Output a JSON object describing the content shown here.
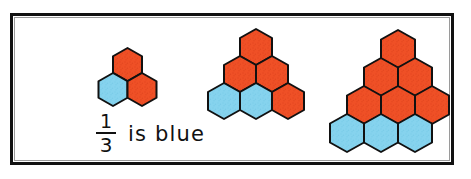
{
  "figure": {
    "kind": "hexagon-fraction-illustration",
    "background_color": "#ffffff",
    "frame_color": "#111111",
    "colors": {
      "orange": "#ef5026",
      "orange_shade": "#d8401a",
      "blue": "#86d3ee",
      "blue_shade": "#6ec4e4",
      "outline": "#111111",
      "text": "#111111"
    }
  },
  "caption": {
    "numerator": "1",
    "denominator": "3",
    "words": "is blue",
    "full_text": "1/3 is blue"
  },
  "groups": [
    {
      "name": "group-1",
      "total_hexagons": 3,
      "blue_hexagons": 1,
      "orange_hexagons": 2,
      "fraction_blue": "1/3",
      "rows": [
        {
          "count": 1,
          "colors": [
            "orange"
          ]
        },
        {
          "count": 2,
          "colors": [
            "blue",
            "orange"
          ]
        }
      ]
    },
    {
      "name": "group-2",
      "total_hexagons": 6,
      "blue_hexagons": 2,
      "orange_hexagons": 4,
      "fraction_blue": "2/6",
      "rows": [
        {
          "count": 1,
          "colors": [
            "orange"
          ]
        },
        {
          "count": 2,
          "colors": [
            "orange",
            "orange"
          ]
        },
        {
          "count": 3,
          "colors": [
            "blue",
            "blue",
            "orange"
          ]
        }
      ]
    },
    {
      "name": "group-3",
      "total_hexagons": 9,
      "blue_hexagons": 3,
      "orange_hexagons": 6,
      "fraction_blue": "3/9",
      "rows": [
        {
          "count": 1,
          "colors": [
            "orange"
          ]
        },
        {
          "count": 2,
          "colors": [
            "orange",
            "orange"
          ]
        },
        {
          "count": 3,
          "colors": [
            "orange",
            "orange",
            "orange"
          ]
        },
        {
          "count": 3,
          "colors": [
            "blue",
            "blue",
            "blue"
          ]
        }
      ]
    }
  ],
  "layout": {
    "group_1": {
      "left": 84,
      "top": 46,
      "hex_width": 29,
      "hex_height": 33,
      "row_offset_x": -14.5,
      "row_step_y": 25
    },
    "group_2": {
      "left": 192,
      "top": 27,
      "hex_width": 32,
      "hex_height": 36,
      "row_offset_x": -16,
      "row_step_y": 27
    },
    "group_3": {
      "left": 330,
      "top": 28,
      "hex_width": 34,
      "hex_height": 38,
      "row_offset_x": -17,
      "row_step_y": 28
    },
    "caption": {
      "left": 96,
      "top": 112
    }
  }
}
